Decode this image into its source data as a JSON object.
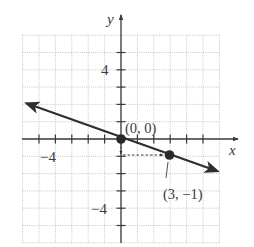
{
  "chart_data": {
    "type": "line",
    "title": "",
    "xlabel": "x",
    "ylabel": "y",
    "xlim": [
      -6,
      6
    ],
    "ylim": [
      -6,
      6
    ],
    "grid": true,
    "grid_style": "dotted",
    "x_ticks": [
      -5,
      -4,
      -3,
      -2,
      -1,
      1,
      2,
      3,
      4,
      5
    ],
    "y_ticks": [
      -5,
      -4,
      -3,
      -2,
      -1,
      1,
      2,
      3,
      4,
      5
    ],
    "x_tick_labels": [
      {
        "value": -4,
        "label": "−4"
      }
    ],
    "y_tick_labels": [
      {
        "value": 4,
        "label": "4"
      },
      {
        "value": -4,
        "label": "−4"
      }
    ],
    "series": [
      {
        "name": "line",
        "equation": "y = -x/3",
        "x": [
          -5.9,
          5.9
        ],
        "y": [
          1.97,
          -1.97
        ],
        "arrows": "both"
      }
    ],
    "points": [
      {
        "x": 0,
        "y": 0,
        "label": "(0, 0)"
      },
      {
        "x": 3,
        "y": -1,
        "label": "(3, −1)"
      }
    ],
    "annotations": [
      {
        "type": "dashed-arrow",
        "from": [
          0,
          0
        ],
        "to": [
          0,
          -1
        ],
        "note": "rise -1"
      },
      {
        "type": "dashed-arrow",
        "from": [
          0,
          -1
        ],
        "to": [
          3,
          -1
        ],
        "note": "run 3"
      }
    ]
  },
  "labels": {
    "x_axis": "x",
    "y_axis": "y",
    "tick_y_4": "4",
    "tick_y_neg4": "−4",
    "tick_x_neg4": "−4",
    "point_origin": "(0, 0)",
    "point_3_neg1": "(3, −1)"
  },
  "colors": {
    "axis": "#3a3a3a",
    "line": "#2e2e2e",
    "grid": "#b8b8b8",
    "point": "#2a2a2a"
  }
}
